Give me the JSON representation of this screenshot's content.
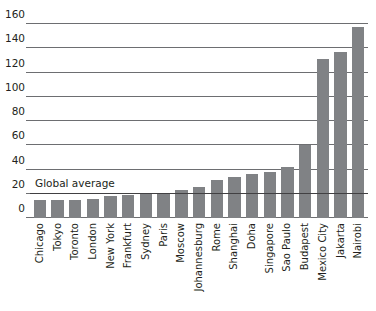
{
  "chart_data": {
    "type": "bar",
    "title": "",
    "subtitle": "",
    "xlabel": "",
    "ylabel": "",
    "ylim": [
      0,
      165
    ],
    "yticks": [
      0,
      20,
      40,
      60,
      80,
      100,
      120,
      140,
      160
    ],
    "grid": true,
    "legend": "none",
    "bar_color": "#808285",
    "categories": [
      "Chicago",
      "Tokyo",
      "Toronto",
      "London",
      "New York",
      "Frankfurt",
      "Sydney",
      "Paris",
      "Moscow",
      "Johannesburg",
      "Rome",
      "Shanghai",
      "Doha",
      "Singapore",
      "Sao Paulo",
      "Budapest",
      "Mexico City",
      "Jakarta",
      "Nairobi"
    ],
    "values": [
      15,
      15,
      15,
      16,
      18,
      19,
      20,
      21,
      23,
      26,
      31,
      34,
      36,
      38,
      42,
      60,
      131,
      137,
      158
    ],
    "annotations": [
      {
        "name": "global-average",
        "label": "Global average",
        "value": 20,
        "style": "horizontal-line"
      }
    ]
  },
  "axis": {
    "ytick_labels": [
      "160",
      "140",
      "120",
      "100",
      "80",
      "60",
      "40",
      "20",
      "0"
    ]
  }
}
